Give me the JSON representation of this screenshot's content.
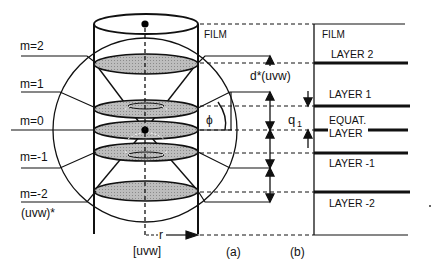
{
  "diagram": {
    "left_labels": {
      "m2": "m=2",
      "m1": "m=1",
      "m0": "m=0",
      "mneg1": "m=-1",
      "mneg2": "m=-2",
      "reciprocal": "(uvw)*"
    },
    "axis_label": "[uvw]",
    "radius_label": "r",
    "angle_label": "ϕ",
    "spacing_label": "d*(uvw)",
    "q_label": "q",
    "q_sub": "1",
    "panel_a": {
      "caption": "(a)",
      "film_label": "FILM"
    },
    "panel_b": {
      "caption": "(b)",
      "film_label": "FILM",
      "layers": [
        "LAYER 2",
        "LAYER 1",
        "EQUAT.",
        "LAYER",
        "LAYER -1",
        "LAYER -2"
      ]
    }
  }
}
